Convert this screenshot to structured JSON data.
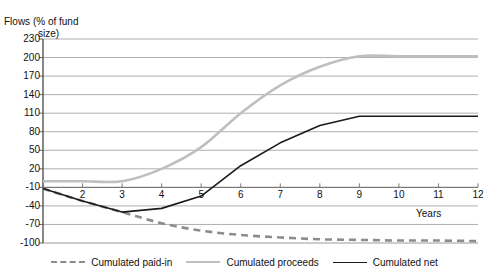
{
  "chart_data": {
    "type": "line",
    "title": "",
    "ylabel": "Flows (% of fund size)",
    "ylabel_line1": "Flows (% of fund",
    "ylabel_line2": "size)",
    "xlabel": "Years",
    "ylim": [
      -100,
      230
    ],
    "xlim": [
      1,
      12
    ],
    "grid": true,
    "legend_position": "bottom",
    "yticks": [
      230,
      200,
      170,
      140,
      110,
      80,
      50,
      20,
      -10,
      -40,
      -70,
      -100
    ],
    "ytick_labels": [
      "230",
      "200",
      "170",
      "140",
      "110",
      "80",
      "50",
      "20",
      "-10",
      "-40",
      "-70",
      "-100"
    ],
    "xticks": [
      1,
      2,
      3,
      4,
      5,
      6,
      7,
      8,
      9,
      10,
      11,
      12
    ],
    "xtick_labels": [
      "",
      "2",
      "3",
      "4",
      "5",
      "6",
      "7",
      "8",
      "9",
      "10",
      "11",
      "12"
    ],
    "x": [
      1,
      2,
      3,
      4,
      5,
      6,
      7,
      8,
      9,
      10,
      11,
      12
    ],
    "series": [
      {
        "name": "Cumulated paid-in",
        "color": "#8c8c8c",
        "style": "dashed",
        "width": 2.6,
        "values": [
          -12,
          -32,
          -50,
          -68,
          -80,
          -87,
          -91,
          -94,
          -95,
          -96,
          -96,
          -97
        ]
      },
      {
        "name": "Cumulated proceeds",
        "color": "#bfbfbf",
        "style": "solid",
        "width": 2.6,
        "values": [
          0,
          0,
          0,
          20,
          55,
          110,
          155,
          185,
          202,
          202,
          202,
          202
        ]
      },
      {
        "name": "Cumulated net",
        "color": "#1a1a1a",
        "style": "solid",
        "width": 1.6,
        "values": [
          -12,
          -32,
          -50,
          -44,
          -24,
          25,
          62,
          90,
          105,
          105,
          105,
          105
        ]
      }
    ],
    "legend": [
      {
        "label": "Cumulated paid-in",
        "color": "#8c8c8c",
        "style": "dashed"
      },
      {
        "label": "Cumulated proceeds",
        "color": "#bfbfbf",
        "style": "solid"
      },
      {
        "label": "Cumulated net",
        "color": "#1a1a1a",
        "style": "solid"
      }
    ]
  }
}
